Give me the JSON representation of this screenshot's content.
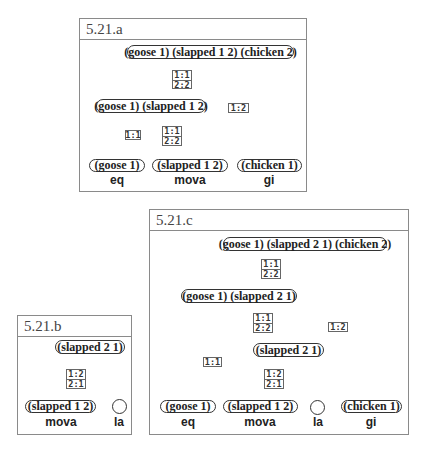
{
  "panels": {
    "a": {
      "title": "5.21.a",
      "nodes": {
        "root": "(goose 1) (slapped 1 2) (chicken 2)",
        "mid": "(goose 1) (slapped 1 2)",
        "leaf_goose": "(goose 1)",
        "leaf_slapped": "(slapped 1 2)",
        "leaf_chicken": "(chicken 1)"
      },
      "edge_labels": {
        "root_mid": [
          "1:1",
          "2:2"
        ],
        "root_chicken": [
          "1:2"
        ],
        "mid_goose": [
          "1:1"
        ],
        "mid_slapped": [
          "1:1",
          "2:2"
        ]
      },
      "words": [
        "eq",
        "mova",
        "gi"
      ]
    },
    "b": {
      "title": "5.21.b",
      "nodes": {
        "root": "(slapped 2 1)",
        "leaf_slapped": "(slapped 1 2)",
        "leaf_empty": ""
      },
      "edge_labels": {
        "root_slapped": [
          "1:2",
          "2:1"
        ]
      },
      "words": [
        "mova",
        "la"
      ]
    },
    "c": {
      "title": "5.21.c",
      "nodes": {
        "root": "(goose 1) (slapped 2 1) (chicken 2)",
        "mid": "(goose 1) (slapped 2 1)",
        "sub": "(slapped 2 1)",
        "leaf_goose": "(goose 1)",
        "leaf_slapped": "(slapped 1 2)",
        "leaf_empty": "",
        "leaf_chicken": "(chicken 1)"
      },
      "edge_labels": {
        "root_mid": [
          "1:1",
          "2:2"
        ],
        "root_chicken": [
          "1:2"
        ],
        "mid_goose": [
          "1:1"
        ],
        "mid_sub": [
          "1:1",
          "2:2"
        ],
        "sub_slapped": [
          "1:2",
          "2:1"
        ]
      },
      "words": [
        "eq",
        "mova",
        "la",
        "gi"
      ]
    }
  }
}
